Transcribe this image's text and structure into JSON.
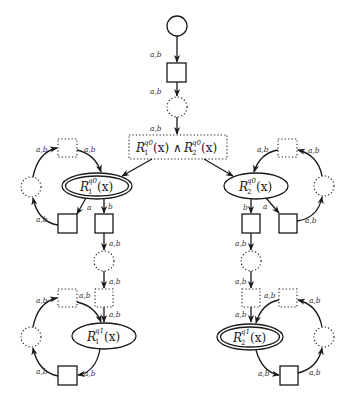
{
  "diagram": {
    "edge_labels": {
      "ab": "a,b",
      "a": "a",
      "b": "b"
    },
    "nodes": {
      "conj": {
        "R1": "R",
        "R1_sup": "q0",
        "R1_sub": "1",
        "x1": "(x)",
        "and": "∧",
        "R2": "R",
        "R2_sup": "q0",
        "R2_sub": "2",
        "x2": "(x)"
      },
      "r1q0": {
        "R": "R",
        "sup": "q0",
        "sub": "1",
        "arg": "(x)"
      },
      "r2q0": {
        "R": "R",
        "sup": "q0",
        "sub": "2",
        "arg": "(x)"
      },
      "r1q1": {
        "R": "R",
        "sup": "q1",
        "sub": "1",
        "arg": "(x)"
      },
      "r2q1": {
        "R": "R",
        "sup": "q1",
        "sub": "2",
        "arg": "(x)"
      }
    },
    "colors": {
      "ink": "#1a1a1a",
      "label": "#333333",
      "background": "#ffffff"
    }
  }
}
